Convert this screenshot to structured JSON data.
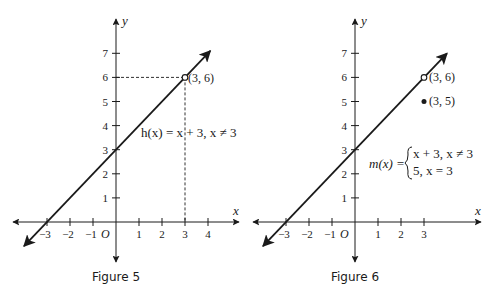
{
  "chart_data": [
    {
      "type": "line",
      "title": "Figure 5",
      "xlabel": "x",
      "ylabel": "y",
      "origin_label": "O",
      "x_ticks": [
        -3,
        -2,
        -1,
        1,
        2,
        3,
        4
      ],
      "x_tick_labels": [
        "−3",
        "−2",
        "−1",
        "1",
        "2",
        "3",
        "4"
      ],
      "y_ticks": [
        1,
        2,
        3,
        4,
        5,
        6,
        7
      ],
      "y_tick_labels": [
        "1",
        "2",
        "3",
        "4",
        "5",
        "6",
        "7"
      ],
      "xlim": [
        -4.5,
        5.3
      ],
      "ylim": [
        -1.6,
        8.5
      ],
      "grid": false,
      "series": [
        {
          "name": "h(x) = x + 3, x ≠ 3",
          "kind": "line",
          "equation": "y = x + 3",
          "x": [
            -4,
            4.1
          ],
          "y": [
            -1,
            7.1
          ],
          "arrows": "both"
        }
      ],
      "points": [
        {
          "x": 3,
          "y": 6,
          "label": "(3, 6)",
          "style": "open"
        }
      ],
      "guides": [
        {
          "from": [
            0,
            6
          ],
          "to": [
            3,
            6
          ],
          "style": "dashed"
        },
        {
          "from": [
            3,
            6
          ],
          "to": [
            3,
            0
          ],
          "style": "dashed"
        }
      ],
      "annotations": [
        {
          "text": "h(x) = x + 3, x ≠ 3"
        }
      ],
      "caption": "Figure 5"
    },
    {
      "type": "line",
      "title": "Figure 6",
      "xlabel": "x",
      "ylabel": "y",
      "origin_label": "O",
      "x_ticks": [
        -3,
        -2,
        -1,
        1,
        2,
        3
      ],
      "x_tick_labels": [
        "−3",
        "−2",
        "−1",
        "1",
        "2",
        "3"
      ],
      "y_ticks": [
        1,
        2,
        3,
        4,
        5,
        6,
        7
      ],
      "y_tick_labels": [
        "1",
        "2",
        "3",
        "4",
        "5",
        "6",
        "7"
      ],
      "xlim": [
        -4.4,
        5.5
      ],
      "ylim": [
        -1.6,
        8.5
      ],
      "grid": false,
      "series": [
        {
          "name": "m(x)",
          "kind": "line",
          "equation": "y = x + 3 for x ≠ 3; y = 5 for x = 3",
          "x": [
            -4,
            4
          ],
          "y": [
            -1,
            7
          ],
          "arrows": "both"
        }
      ],
      "points": [
        {
          "x": 3,
          "y": 6,
          "label": "(3, 6)",
          "style": "open"
        },
        {
          "x": 3,
          "y": 5,
          "label": "(3, 5)",
          "style": "filled"
        }
      ],
      "annotations": [
        {
          "text": "m(x) = { x + 3, x ≠ 3 ; 5, x = 3 }"
        }
      ],
      "piecewise": {
        "lhs": "m(x) =",
        "case1": "x + 3, x ≠ 3",
        "case2": "5, x = 3"
      },
      "caption": "Figure 6"
    }
  ],
  "figures": [
    {
      "caption": "Figure 5",
      "function_label": "h(x) = x + 3, x ≠ 3",
      "point_labels": [
        "(3, 6)"
      ]
    },
    {
      "caption": "Figure 6",
      "function_lhs": "m(x) =",
      "case1": "x + 3, x ≠ 3",
      "case2": "5, x = 3",
      "point_labels": [
        "(3, 6)",
        "(3, 5)"
      ]
    }
  ],
  "layout": [
    {
      "ox": 116,
      "oy": 222,
      "ux": 23,
      "uy": 24.1,
      "xleft": 13,
      "xright": 239,
      "ytop": 19,
      "ybottom": 262,
      "capx": 116,
      "capy": 281
    },
    {
      "ox": 355,
      "oy": 222,
      "ux": 23,
      "uy": 24.1,
      "xleft": 253,
      "xright": 481,
      "ytop": 19,
      "ybottom": 262,
      "capx": 355,
      "capy": 281
    }
  ],
  "colors": {
    "ink": "#1a1a1a",
    "background": "#ffffff"
  }
}
